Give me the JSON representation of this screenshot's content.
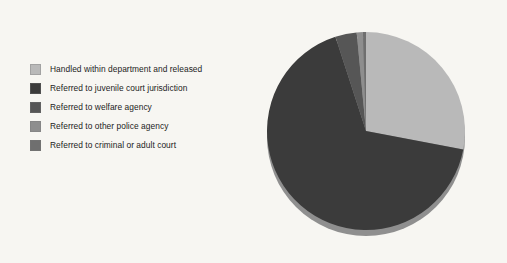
{
  "background_color": "#f7f6f2",
  "legend": {
    "position": "left",
    "items": [
      {
        "label": "Handled within department and released",
        "color": "#b9b9b9"
      },
      {
        "label": "Referred to juvenile court jurisdiction",
        "color": "#3b3b3b"
      },
      {
        "label": "Referred to welfare agency",
        "color": "#565656"
      },
      {
        "label": "Referred to other police agency",
        "color": "#8e8e8e"
      },
      {
        "label": "Referred to criminal or adult court",
        "color": "#6f6f6f"
      }
    ]
  },
  "chart_data": {
    "type": "pie",
    "title": "",
    "xlabel": "",
    "ylabel": "",
    "legend_position": "left",
    "grid": false,
    "start_angle_deg": 0,
    "direction": "clockwise",
    "categories": [
      "Handled within department and released",
      "Referred to juvenile court jurisdiction",
      "Referred to welfare agency",
      "Referred to other police agency",
      "Referred to criminal or adult court"
    ],
    "values": [
      28.0,
      67.0,
      3.5,
      1.0,
      0.5
    ],
    "units": "percent",
    "colors": [
      "#b9b9b9",
      "#3b3b3b",
      "#565656",
      "#8e8e8e",
      "#6f6f6f"
    ],
    "slices": [
      {
        "label": "Handled within department and released",
        "value": 28.0,
        "color": "#b9b9b9",
        "start_deg": 0,
        "end_deg": 100.8
      },
      {
        "label": "Referred to juvenile court jurisdiction",
        "value": 67.0,
        "color": "#3b3b3b",
        "start_deg": 100.8,
        "end_deg": 342.0
      },
      {
        "label": "Referred to welfare agency",
        "value": 3.5,
        "color": "#565656",
        "start_deg": 342.0,
        "end_deg": 354.6
      },
      {
        "label": "Referred to other police agency",
        "value": 1.0,
        "color": "#8e8e8e",
        "start_deg": 354.6,
        "end_deg": 358.2
      },
      {
        "label": "Referred to criminal or adult court",
        "value": 0.5,
        "color": "#6f6f6f",
        "start_deg": 358.2,
        "end_deg": 360.0
      }
    ],
    "geometry": {
      "center_x": 104,
      "center_y": 109,
      "radius": 99,
      "depth": 6,
      "shadow_color": "#8f8f8f"
    }
  }
}
